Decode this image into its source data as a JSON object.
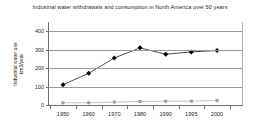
{
  "chart_data": {
    "type": "line",
    "title": "Industrial water withdrawals and consumption in North America over 50 years",
    "xlabel": "",
    "ylabel": "Industrial water use km3/year",
    "ylabel_lines": [
      "Industrial water use",
      "km3/year"
    ],
    "categories": [
      "1950",
      "1960",
      "1970",
      "1980",
      "1990",
      "1995",
      "2000"
    ],
    "x": [
      1950,
      1960,
      1970,
      1980,
      1990,
      1995,
      2000
    ],
    "ylim": [
      0,
      450
    ],
    "yticks": [
      0,
      100,
      200,
      300,
      400
    ],
    "ytick_labels": [
      "0",
      "100",
      "200",
      "300",
      "400"
    ],
    "grid": true,
    "legend": "none",
    "series": [
      {
        "name": "Industrial water withdrawals",
        "marker": "diamond",
        "color": "#000000",
        "values": [
          110,
          172,
          255,
          310,
          275,
          288,
          295
        ]
      },
      {
        "name": "Industrial water consumption",
        "marker": "square",
        "color": "#9a9a9a",
        "values": [
          12,
          12,
          16,
          19,
          20,
          21,
          24
        ]
      }
    ]
  }
}
